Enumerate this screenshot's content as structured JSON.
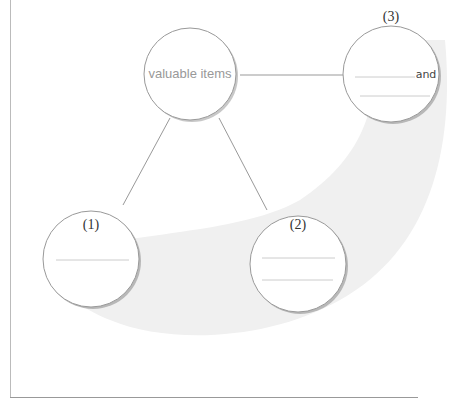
{
  "diagram": {
    "center": {
      "label": "valuable items"
    },
    "nodes": [
      {
        "number": "(1)",
        "blank_lines": 1
      },
      {
        "number": "(2)",
        "blank_lines": 2
      },
      {
        "number": "(3)",
        "blank_lines": 2,
        "inline_text": "and"
      }
    ]
  },
  "colors": {
    "band": "#f0f0f0",
    "circle_border": "#999999",
    "line": "#999999"
  }
}
